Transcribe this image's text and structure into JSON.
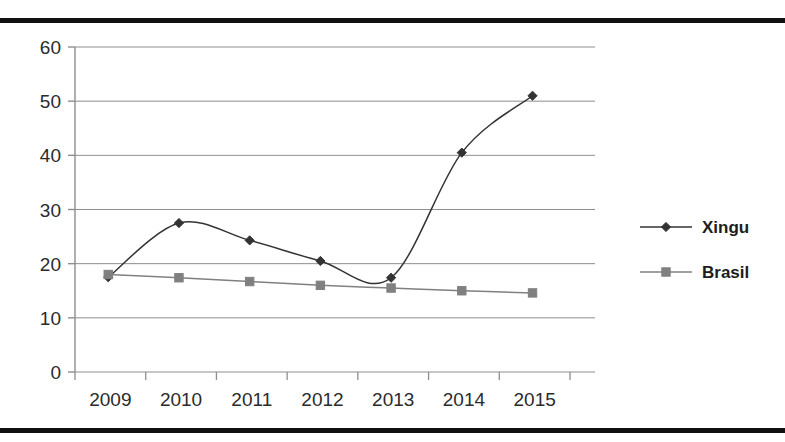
{
  "figure": {
    "cropped_caption_fragment": "",
    "top_rule_color": "#111111",
    "bottom_rule_color": "#111111"
  },
  "chart_data": {
    "type": "line",
    "title": "",
    "xlabel": "",
    "ylabel": "",
    "categories": [
      "2009",
      "2010",
      "2011",
      "2012",
      "2013",
      "2014",
      "2015"
    ],
    "series": [
      {
        "name": "Xingu",
        "values": [
          17.5,
          27.5,
          24.3,
          20.5,
          17.4,
          40.5,
          51.0
        ],
        "color": "#333333",
        "marker": "diamond"
      },
      {
        "name": "Brasil",
        "values": [
          18.0,
          17.4,
          16.7,
          16.0,
          15.5,
          15.0,
          14.6
        ],
        "color": "#808080",
        "marker": "square"
      }
    ],
    "ylim": [
      0,
      60
    ],
    "ytick_values": [
      "0",
      "10",
      "20",
      "30",
      "40",
      "50",
      "60"
    ],
    "grid": true,
    "grid_axis": "y",
    "legend_position": "right",
    "smoothing": "spline"
  }
}
